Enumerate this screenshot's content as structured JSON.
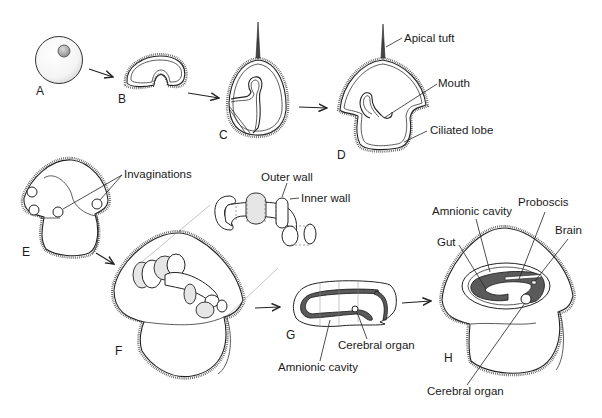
{
  "figure": {
    "stages": [
      {
        "id": "A",
        "label": "A"
      },
      {
        "id": "B",
        "label": "B"
      },
      {
        "id": "C",
        "label": "C"
      },
      {
        "id": "D",
        "label": "D"
      },
      {
        "id": "E",
        "label": "E"
      },
      {
        "id": "F",
        "label": "F"
      },
      {
        "id": "G",
        "label": "G"
      },
      {
        "id": "H",
        "label": "H"
      }
    ],
    "annotations": {
      "apical_tuft": "Apical tuft",
      "mouth": "Mouth",
      "ciliated_lobe": "Ciliated lobe",
      "invaginations": "Invaginations",
      "outer_wall": "Outer wall",
      "inner_wall": "Inner wall",
      "g_cerebral_organ": "Cerebral organ",
      "g_amnionic_cavity": "Amnionic cavity",
      "h_amnionic_cavity": "Amnionic cavity",
      "h_proboscis": "Proboscis",
      "h_brain": "Brain",
      "h_gut": "Gut",
      "h_cerebral_organ": "Cerebral organ"
    },
    "colors": {
      "line": "#222222",
      "tissue_dark": "#5a5a5a",
      "shading": "#e6e6e6",
      "background": "#ffffff"
    }
  }
}
